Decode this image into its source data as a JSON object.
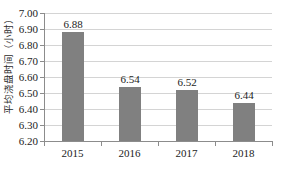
{
  "chart_data": {
    "type": "bar",
    "title": "",
    "xlabel": "",
    "ylabel": "平均浇盘时间（小时）",
    "categories": [
      "2015",
      "2016",
      "2017",
      "2018"
    ],
    "values": [
      6.88,
      6.54,
      6.52,
      6.44
    ],
    "value_labels": [
      "6.88",
      "6.54",
      "6.52",
      "6.44"
    ],
    "ylim": [
      6.2,
      7.0
    ],
    "ytick_step": 0.1,
    "yticks": [
      7.0,
      6.9,
      6.8,
      6.7,
      6.6,
      6.5,
      6.4,
      6.3,
      6.2
    ],
    "ytick_labels": [
      "7.00",
      "6.90",
      "6.80",
      "6.70",
      "6.60",
      "6.50",
      "6.40",
      "6.30",
      "6.20"
    ],
    "grid": true,
    "grid_axis": "y",
    "legend": false,
    "legend_position": "none",
    "series": [
      {
        "name": "平均浇盘时间（小时）",
        "values": [
          6.88,
          6.54,
          6.52,
          6.44
        ]
      }
    ],
    "colors": {
      "bar": "#808080",
      "gridline": "#d4d4d4",
      "axis": "#8c8c8c",
      "text": "#1c1c1c",
      "background": "#ffffff"
    }
  }
}
